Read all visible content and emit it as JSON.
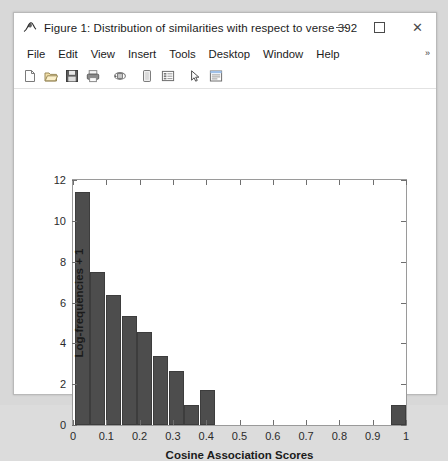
{
  "window": {
    "title": "Figure 1: Distribution of similarities with respect to verse 392",
    "app_icon": "matlab-figure-icon",
    "controls": {
      "minimize": "minimize-button",
      "maximize": "maximize-button",
      "close": "close-button",
      "close_glyph": "✕"
    }
  },
  "menubar": {
    "items": [
      {
        "label": "File"
      },
      {
        "label": "Edit"
      },
      {
        "label": "View"
      },
      {
        "label": "Insert"
      },
      {
        "label": "Tools"
      },
      {
        "label": "Desktop"
      },
      {
        "label": "Window"
      },
      {
        "label": "Help"
      }
    ],
    "overflow_glyph": "»"
  },
  "toolbar": {
    "buttons": [
      {
        "name": "new-figure-icon",
        "tip": "New Figure"
      },
      {
        "name": "open-file-icon",
        "tip": "Open File"
      },
      {
        "name": "save-figure-icon",
        "tip": "Save Figure"
      },
      {
        "name": "print-figure-icon",
        "tip": "Print Figure"
      },
      {
        "name": "rotate-3d-icon",
        "tip": "Rotate 3D"
      },
      {
        "name": "data-cursor-icon",
        "tip": "Data Cursor"
      },
      {
        "name": "insert-legend-icon",
        "tip": "Insert Legend"
      },
      {
        "name": "edit-plot-arrow-icon",
        "tip": "Edit Plot"
      },
      {
        "name": "show-plot-tools-icon",
        "tip": "Show Plot Tools"
      }
    ]
  },
  "chart_data": {
    "type": "bar",
    "title": "",
    "subtitle": "",
    "xlabel": "Cosine Association Scores",
    "ylabel": "Log-frequencies + 1",
    "xlim": [
      0,
      1
    ],
    "ylim": [
      0,
      12
    ],
    "xticks": [
      0,
      0.1,
      0.2,
      0.3,
      0.4,
      0.5,
      0.6,
      0.7,
      0.8,
      0.9,
      1
    ],
    "xticklabels": [
      "0",
      "0.1",
      "0.2",
      "0.3",
      "0.4",
      "0.5",
      "0.6",
      "0.7",
      "0.8",
      "0.9",
      "1"
    ],
    "yticks": [
      0,
      2,
      4,
      6,
      8,
      10,
      12
    ],
    "yticklabels": [
      "0",
      "2",
      "4",
      "6",
      "8",
      "10",
      "12"
    ],
    "grid": false,
    "legend": null,
    "bar_color": "#4d4d4d",
    "bar_edge_color": "#3d3d3d",
    "bin_width": 0.045,
    "bins": [
      {
        "x_start": 0.005,
        "x_end": 0.05,
        "x_center": 0.0275,
        "value": 11.4
      },
      {
        "x_start": 0.052,
        "x_end": 0.097,
        "x_center": 0.0745,
        "value": 7.5
      },
      {
        "x_start": 0.099,
        "x_end": 0.144,
        "x_center": 0.1215,
        "value": 6.35
      },
      {
        "x_start": 0.146,
        "x_end": 0.191,
        "x_center": 0.1685,
        "value": 5.35
      },
      {
        "x_start": 0.193,
        "x_end": 0.238,
        "x_center": 0.2155,
        "value": 4.55
      },
      {
        "x_start": 0.24,
        "x_end": 0.285,
        "x_center": 0.2625,
        "value": 3.4
      },
      {
        "x_start": 0.287,
        "x_end": 0.332,
        "x_center": 0.3095,
        "value": 2.65
      },
      {
        "x_start": 0.334,
        "x_end": 0.379,
        "x_center": 0.3565,
        "value": 1.0
      },
      {
        "x_start": 0.381,
        "x_end": 0.426,
        "x_center": 0.4035,
        "value": 1.7
      },
      {
        "x_start": 0.955,
        "x_end": 1.0,
        "x_center": 0.9775,
        "value": 1.0
      }
    ],
    "categories": [
      "0.03",
      "0.07",
      "0.12",
      "0.17",
      "0.22",
      "0.26",
      "0.31",
      "0.36",
      "0.40",
      "0.98"
    ],
    "values": [
      11.4,
      7.5,
      6.35,
      5.35,
      4.55,
      3.4,
      2.65,
      1.0,
      1.7,
      1.0
    ]
  },
  "colors": {
    "window_background": "#ffffff",
    "desktop_background": "#d8d8d8",
    "axis_line": "#9a9a9a",
    "tick_color": "#6f6f6f",
    "text": "#1b1b1b",
    "accent_close": "#e81123"
  }
}
